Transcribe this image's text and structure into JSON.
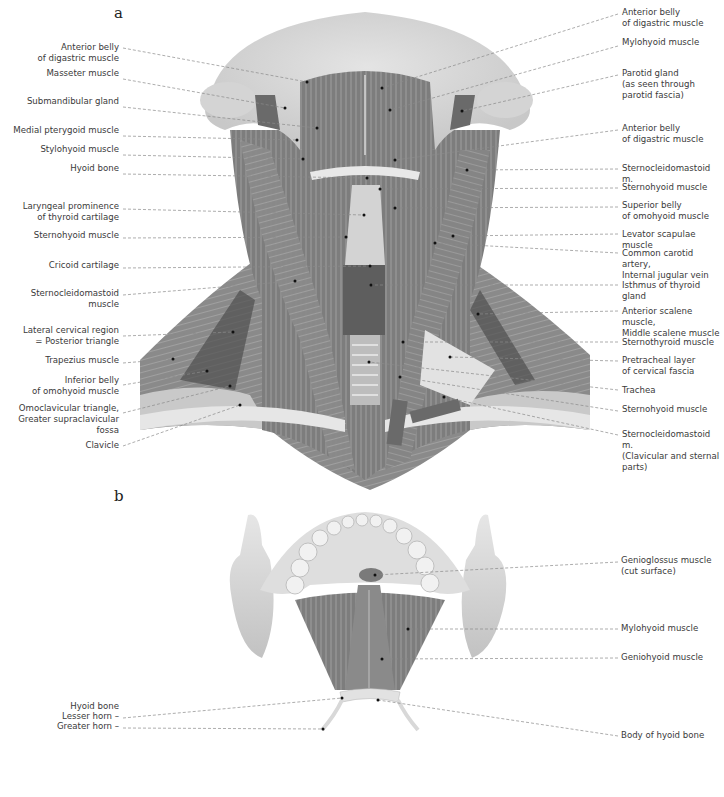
{
  "figure": {
    "panels": [
      {
        "letter": "a",
        "title": "Anterior view of the neck muscles",
        "labels_left": [
          {
            "text": "Anterior belly\nof digastric muscle",
            "y": 42,
            "lines": 2,
            "tx": 307,
            "ty": 82
          },
          {
            "text": "Masseter muscle",
            "y": 73,
            "lines": 1,
            "tx": 285,
            "ty": 108
          },
          {
            "text": "Submandibular gland",
            "y": 101,
            "lines": 1,
            "tx": 317,
            "ty": 128
          },
          {
            "text": "Medial pterygoid muscle",
            "y": 130,
            "lines": 1,
            "tx": 297,
            "ty": 140
          },
          {
            "text": "Stylohyoid muscle",
            "y": 149,
            "lines": 1,
            "tx": 303,
            "ty": 159
          },
          {
            "text": "Hyoid bone",
            "y": 168,
            "lines": 1,
            "tx": 367,
            "ty": 178
          },
          {
            "text": "Laryngeal prominence\nof thyroid cartilage",
            "y": 203,
            "lines": 2,
            "tx": 364,
            "ty": 215
          },
          {
            "text": "Sternohyoid muscle",
            "y": 232,
            "lines": 1,
            "tx": 346,
            "ty": 237
          },
          {
            "text": "Cricoid cartilage",
            "y": 262,
            "lines": 1,
            "tx": 370,
            "ty": 266
          },
          {
            "text": "Sternocleidomastoid muscle",
            "y": 289,
            "lines": 1,
            "tx": 295,
            "ty": 281
          },
          {
            "text": "Lateral cervical region\n= Posterior triangle",
            "y": 330,
            "lines": 2,
            "tx": 233,
            "ty": 332
          },
          {
            "text": "Trapezius muscle",
            "y": 357,
            "lines": 1,
            "tx": 173,
            "ty": 359
          },
          {
            "text": "Inferior belly\nof omohyoid muscle",
            "y": 379,
            "lines": 2,
            "tx": 207,
            "ty": 371
          },
          {
            "text": "Omoclavicular triangle,\nGreater supraclavicular fossa",
            "y": 407,
            "lines": 2,
            "tx": 230,
            "ty": 386
          },
          {
            "text": "Clavicle",
            "y": 440,
            "lines": 1,
            "tx": 240,
            "ty": 405
          }
        ],
        "labels_right": [
          {
            "text": "Anterior belly\nof digastric muscle",
            "y": 8,
            "lines": 2,
            "tx": 382,
            "ty": 88
          },
          {
            "text": "Mylohyoid muscle",
            "y": 40,
            "lines": 1,
            "tx": 390,
            "ty": 110
          },
          {
            "text": "Parotid gland\n(as seen through\nparotid fascia)",
            "y": 69,
            "lines": 3,
            "tx": 462,
            "ty": 111
          },
          {
            "text": "Anterior belly\nof digastric muscle",
            "y": 124,
            "lines": 2,
            "tx": 395,
            "ty": 160
          },
          {
            "text": "Sternocleidomastoid m.",
            "y": 163,
            "lines": 1,
            "tx": 467,
            "ty": 170
          },
          {
            "text": "Sternohyoid muscle",
            "y": 182,
            "lines": 1,
            "tx": 380,
            "ty": 189
          },
          {
            "text": "Superior belly\nof omohyoid muscle",
            "y": 201,
            "lines": 2,
            "tx": 395,
            "ty": 208
          },
          {
            "text": "Levator scapulae muscle",
            "y": 228,
            "lines": 1,
            "tx": 453,
            "ty": 236
          },
          {
            "text": "Common carotid artery,\nInternal jugular vein",
            "y": 247,
            "lines": 2,
            "tx": 435,
            "ty": 243
          },
          {
            "text": "Isthmus of thyroid gland",
            "y": 279,
            "lines": 1,
            "tx": 371,
            "ty": 285
          },
          {
            "text": "Anterior scalene muscle,\nMiddle scalene muscle",
            "y": 305,
            "lines": 2,
            "tx": 478,
            "ty": 314
          },
          {
            "text": "Sternothyroid muscle",
            "y": 336,
            "lines": 1,
            "tx": 403,
            "ty": 342
          },
          {
            "text": "Pretracheal layer\nof cervical fascia",
            "y": 355,
            "lines": 2,
            "tx": 450,
            "ty": 357
          },
          {
            "text": "Trachea",
            "y": 384,
            "lines": 1,
            "tx": 369,
            "ty": 362
          },
          {
            "text": "Sternohyoid muscle",
            "y": 405,
            "lines": 1,
            "tx": 400,
            "ty": 377
          },
          {
            "text": "Sternocleidomastoid m.\n(Clavicular and sternal parts)",
            "y": 429,
            "lines": 2,
            "tx": 444,
            "ty": 397
          }
        ]
      },
      {
        "letter": "b",
        "title": "Floor of the mouth viewed from below",
        "labels_left": [
          {
            "text": "Hyoid bone",
            "y": 702,
            "lines": 1,
            "tx": null,
            "ty": null
          },
          {
            "text": "Lesser horn –",
            "y": 712,
            "lines": 1,
            "tx": 342,
            "ty": 698
          },
          {
            "text": "Greater horn –",
            "y": 722,
            "lines": 1,
            "tx": 323,
            "ty": 729
          }
        ],
        "labels_right": [
          {
            "text": "Genioglossus muscle\n(cut surface)",
            "y": 556,
            "lines": 2,
            "tx": 375,
            "ty": 575
          },
          {
            "text": "Mylohyoid muscle",
            "y": 623,
            "lines": 1,
            "tx": 408,
            "ty": 629
          },
          {
            "text": "Geniohyoid muscle",
            "y": 652,
            "lines": 1,
            "tx": 382,
            "ty": 659
          },
          {
            "text": "Body of hyoid bone",
            "y": 730,
            "lines": 1,
            "tx": 378,
            "ty": 700
          }
        ]
      }
    ],
    "colors": {
      "muscle_dark": "#6e6e6e",
      "muscle_mid": "#8f8f8f",
      "fascia_light": "#d9d9d9",
      "bone": "#cfcfcf",
      "leader_line": "#8a8a8a",
      "label_text": "#3a3a3a"
    }
  }
}
